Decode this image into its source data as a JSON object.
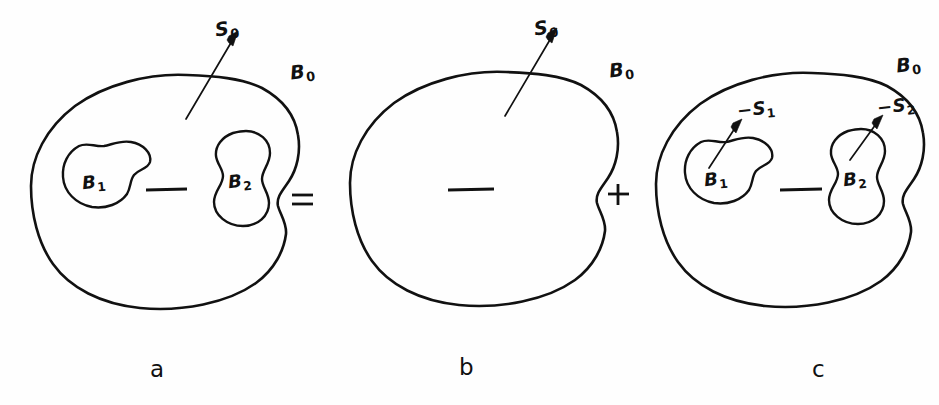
{
  "figure": {
    "background_color": "#fefefe",
    "ink_color": "#111111"
  },
  "equation": {
    "equals_sign": "=",
    "plus_sign": "+"
  },
  "panels": [
    {
      "id": "a",
      "caption": "a",
      "description": "Body B0 containing two cavities B1 and B2, outer surface S0",
      "outer_body_label": "B",
      "outer_body_sub": "0",
      "outer_surface_label": "S",
      "outer_surface_sub": "0",
      "has_outer_surface_arrow": true,
      "inner_bodies": [
        {
          "label": "B",
          "sub": "1",
          "surface_label": null,
          "surface_sub": null
        },
        {
          "label": "B",
          "sub": "2",
          "surface_label": null,
          "surface_sub": null
        }
      ],
      "has_center_dash": true
    },
    {
      "id": "b",
      "caption": "b",
      "description": "Solid body B0 with only the outer surface S0",
      "outer_body_label": "B",
      "outer_body_sub": "0",
      "outer_surface_label": "S",
      "outer_surface_sub": "0",
      "has_outer_surface_arrow": true,
      "inner_bodies": [],
      "has_center_dash": true
    },
    {
      "id": "c",
      "caption": "c",
      "description": "Body B0 with cavity surfaces of reversed orientation -S1 and -S2",
      "outer_body_label": "B",
      "outer_body_sub": "0",
      "outer_surface_label": null,
      "outer_surface_sub": null,
      "has_outer_surface_arrow": false,
      "inner_bodies": [
        {
          "label": "B",
          "sub": "1",
          "surface_label": "−S",
          "surface_sub": "1"
        },
        {
          "label": "B",
          "sub": "2",
          "surface_label": "−S",
          "surface_sub": "2"
        }
      ],
      "has_center_dash": true
    }
  ]
}
